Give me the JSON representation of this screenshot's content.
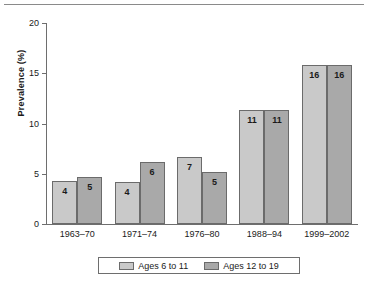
{
  "chart_data": {
    "type": "bar",
    "title": "",
    "subtitle": "",
    "xlabel": "",
    "ylabel": "Prevalence (%)",
    "ylim": [
      0,
      20
    ],
    "yticks": [
      0,
      5,
      10,
      15,
      20
    ],
    "ytick_labels": [
      "0",
      "5",
      "10",
      "15",
      "20"
    ],
    "grid": false,
    "legend_position": "bottom",
    "categories": [
      "1963–70",
      "1971–74",
      "1976–80",
      "1988–94",
      "1999–2002"
    ],
    "series": [
      {
        "name": "Ages 6 to 11",
        "color": "#c9c9c9",
        "values": [
          4.3,
          4.2,
          6.7,
          11.3,
          15.8
        ],
        "labels": [
          "4",
          "4",
          "7",
          "11",
          "16"
        ]
      },
      {
        "name": "Ages 12 to 19",
        "color": "#a9a9a9",
        "values": [
          4.7,
          6.2,
          5.2,
          11.3,
          15.8
        ],
        "labels": [
          "5",
          "6",
          "5",
          "11",
          "16"
        ]
      }
    ]
  },
  "legend": {
    "entries": [
      {
        "label": "Ages 6 to 11"
      },
      {
        "label": "Ages 12 to 19"
      }
    ]
  }
}
